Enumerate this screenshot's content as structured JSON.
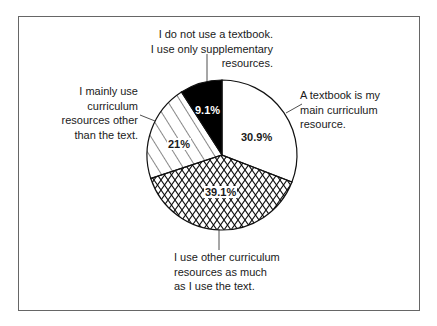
{
  "chart_data": {
    "type": "pie",
    "title": "",
    "categories": [
      "A textbook is my main curriculum resource.",
      "I use other curriculum resources as much as I use the text.",
      "I mainly use curriculum resources other than the text.",
      "I do not use a textbook. I use only supplementary resources."
    ],
    "values": [
      30.9,
      39.1,
      21.0,
      9.1
    ],
    "value_labels": [
      "30.9%",
      "39.1%",
      "21%",
      "9.1%"
    ],
    "fills": [
      "white",
      "crosshatch",
      "diagonal-hatch",
      "black"
    ],
    "start_angle_deg": 0,
    "direction": "clockwise"
  },
  "labels": {
    "textbook_main": "A textbook is my\nmain curriculum\nresource.",
    "other_as_much": "I use other curriculum\nresources as much\nas I use the text.",
    "mainly_other": "I mainly use\ncurriculum\nresources other\nthan the text.",
    "no_textbook": "I do not use a textbook.\nI use only supplementary\nresources."
  },
  "percentages": {
    "textbook_main": "30.9%",
    "other_as_much": "39.1%",
    "mainly_other": "21%",
    "no_textbook": "9.1%"
  }
}
